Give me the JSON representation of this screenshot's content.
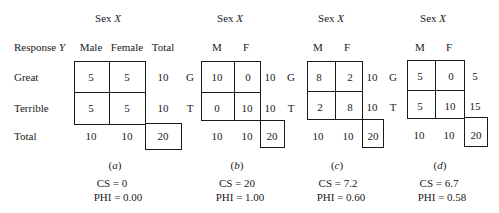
{
  "header": {
    "sex_label": "Sex",
    "sex_var": "X",
    "response_label": "Response",
    "response_var": "Y"
  },
  "table_a": {
    "col_headers": [
      "Male",
      "Female",
      "Total"
    ],
    "row_labels": [
      "Great",
      "Terrible",
      "Total"
    ],
    "cells": [
      [
        "5",
        "5"
      ],
      [
        "5",
        "5"
      ]
    ],
    "row_totals": [
      "10",
      "10"
    ],
    "col_totals": [
      "10",
      "10"
    ],
    "grand_total": "20",
    "caption": "a",
    "cs": "CS = 0",
    "phi": "PHI = 0.00"
  },
  "table_b": {
    "col_headers": [
      "M",
      "F"
    ],
    "row_labels": [
      "G",
      "T"
    ],
    "cells": [
      [
        "10",
        "0"
      ],
      [
        "0",
        "10"
      ]
    ],
    "row_totals": [
      "10",
      "10"
    ],
    "col_totals": [
      "10",
      "10"
    ],
    "grand_total": "20",
    "caption": "b",
    "cs": "CS = 20",
    "phi": "PHI = 1.00"
  },
  "table_c": {
    "col_headers": [
      "M",
      "F"
    ],
    "row_labels": [
      "G",
      "T"
    ],
    "cells": [
      [
        "8",
        "2"
      ],
      [
        "2",
        "8"
      ]
    ],
    "row_totals": [
      "10",
      "10"
    ],
    "col_totals": [
      "10",
      "10"
    ],
    "grand_total": "20",
    "caption": "c",
    "cs": "CS = 7.2",
    "phi": "PHI = 0.60"
  },
  "table_d": {
    "col_headers": [
      "M",
      "F"
    ],
    "row_labels": [
      "G",
      "T"
    ],
    "cells": [
      [
        "5",
        "0"
      ],
      [
        "5",
        "10"
      ]
    ],
    "row_totals": [
      "5",
      "15"
    ],
    "col_totals": [
      "10",
      "10"
    ],
    "grand_total": "20",
    "caption": "d",
    "cs": "CS = 6.7",
    "phi": "PHI = 0.58"
  }
}
